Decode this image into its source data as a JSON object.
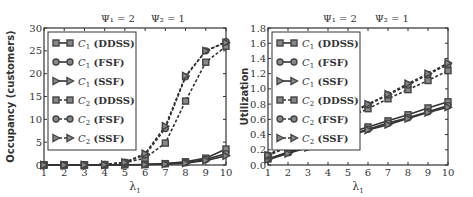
{
  "figure": {
    "annotation": {
      "psi1": "Ψ₁ = 2",
      "psi2": "Ψ₂ = 1"
    }
  },
  "chart_data": [
    {
      "type": "line",
      "title": "Ψ1 = 2    Ψ2 = 1",
      "xlabel": "λ1",
      "ylabel": "Occupancy (customers)",
      "xlim": [
        1,
        10
      ],
      "ylim": [
        0,
        30
      ],
      "xticks": [
        1,
        2,
        3,
        4,
        5,
        6,
        7,
        8,
        9,
        10
      ],
      "yticks": [
        0,
        5,
        10,
        15,
        20,
        25,
        30
      ],
      "x": [
        1,
        2,
        3,
        4,
        5,
        6,
        7,
        8,
        9,
        10
      ],
      "legend_position": "upper left",
      "grid": false,
      "series": [
        {
          "name": "C1 (DDSS)",
          "class": "C1",
          "policy": "DDSS",
          "marker": "square",
          "line": "solid",
          "values": [
            0,
            0,
            0,
            0,
            0.05,
            0.1,
            0.3,
            0.7,
            1.5,
            3.5
          ]
        },
        {
          "name": "C1 (FSF)",
          "class": "C1",
          "policy": "FSF",
          "marker": "circle",
          "line": "solid",
          "values": [
            0,
            0,
            0,
            0,
            0.05,
            0.1,
            0.25,
            0.5,
            1.2,
            2.5
          ]
        },
        {
          "name": "C1 (SSF)",
          "class": "C1",
          "policy": "SSF",
          "marker": "triangle-right",
          "line": "solid",
          "values": [
            0,
            0,
            0,
            0,
            0.05,
            0.1,
            0.2,
            0.4,
            1.0,
            2.0
          ]
        },
        {
          "name": "C2 (DDSS)",
          "class": "C2",
          "policy": "DDSS",
          "marker": "square",
          "line": "dashed",
          "values": [
            0,
            0,
            0,
            0.1,
            0.5,
            1.5,
            4.8,
            14.0,
            22.5,
            26.0
          ]
        },
        {
          "name": "C2 (FSF)",
          "class": "C2",
          "policy": "FSF",
          "marker": "circle",
          "line": "dashed",
          "values": [
            0,
            0,
            0,
            0.1,
            0.6,
            2.2,
            8.0,
            19.3,
            25.0,
            27.0
          ]
        },
        {
          "name": "C2 (SSF)",
          "class": "C2",
          "policy": "SSF",
          "marker": "triangle-right",
          "line": "dashed",
          "values": [
            0,
            0,
            0,
            0.1,
            0.6,
            2.5,
            8.5,
            19.5,
            25.0,
            26.8
          ]
        }
      ]
    },
    {
      "type": "line",
      "title": "Ψ1 = 2    Ψ2 = 1",
      "xlabel": "λ1",
      "ylabel": "Utilization",
      "xlim": [
        1,
        10
      ],
      "ylim": [
        0,
        1.8
      ],
      "xticks": [
        1,
        2,
        3,
        4,
        5,
        6,
        7,
        8,
        9,
        10
      ],
      "yticks": [
        "0.0",
        "0.2",
        "0.4",
        "0.6",
        "0.8",
        "1.0",
        "1.2",
        "1.4",
        "1.6",
        "1.8"
      ],
      "x": [
        1,
        2,
        3,
        4,
        5,
        6,
        7,
        8,
        9,
        10
      ],
      "legend_position": "upper left",
      "grid": false,
      "series": [
        {
          "name": "C1 (DDSS)",
          "class": "C1",
          "policy": "DDSS",
          "marker": "square",
          "line": "solid",
          "values": [
            0.08,
            0.17,
            0.25,
            0.33,
            0.42,
            0.5,
            0.58,
            0.66,
            0.75,
            0.83
          ]
        },
        {
          "name": "C1 (FSF)",
          "class": "C1",
          "policy": "FSF",
          "marker": "circle",
          "line": "solid",
          "values": [
            0.08,
            0.16,
            0.24,
            0.31,
            0.39,
            0.47,
            0.55,
            0.62,
            0.7,
            0.78
          ]
        },
        {
          "name": "C1 (SSF)",
          "class": "C1",
          "policy": "SSF",
          "marker": "triangle-right",
          "line": "solid",
          "values": [
            0.07,
            0.15,
            0.23,
            0.3,
            0.38,
            0.46,
            0.53,
            0.61,
            0.69,
            0.76
          ]
        },
        {
          "name": "C2 (DDSS)",
          "class": "C2",
          "policy": "DDSS",
          "marker": "square",
          "line": "dashed",
          "values": [
            0.12,
            0.24,
            0.37,
            0.49,
            0.62,
            0.74,
            0.87,
            0.99,
            1.11,
            1.24
          ]
        },
        {
          "name": "C2 (FSF)",
          "class": "C2",
          "policy": "FSF",
          "marker": "circle",
          "line": "dashed",
          "values": [
            0.13,
            0.26,
            0.4,
            0.53,
            0.66,
            0.79,
            0.92,
            1.05,
            1.19,
            1.32
          ]
        },
        {
          "name": "C2 (SSF)",
          "class": "C2",
          "policy": "SSF",
          "marker": "triangle-right",
          "line": "dashed",
          "values": [
            0.13,
            0.27,
            0.4,
            0.54,
            0.67,
            0.8,
            0.93,
            1.07,
            1.2,
            1.34
          ]
        }
      ]
    }
  ]
}
